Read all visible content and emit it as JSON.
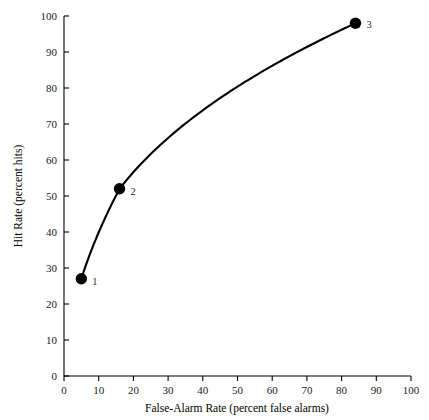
{
  "chart_data": {
    "type": "line",
    "title": "",
    "subtitle": "",
    "xlabel": "False-Alarm Rate (percent false alarms)",
    "ylabel": "Hit Rate (percent hits)",
    "xlim": [
      0,
      100
    ],
    "ylim": [
      0,
      100
    ],
    "grid": false,
    "legend": false,
    "x_ticks": [
      0,
      10,
      20,
      30,
      40,
      50,
      60,
      70,
      80,
      90,
      100
    ],
    "y_ticks": [
      0,
      10,
      20,
      30,
      40,
      50,
      60,
      70,
      80,
      90,
      100
    ],
    "x_tick_labels": [
      "0",
      "10",
      "20",
      "30",
      "40",
      "50",
      "60",
      "70",
      "80",
      "90",
      "100"
    ],
    "y_tick_labels": [
      "0",
      "10",
      "20",
      "30",
      "40",
      "50",
      "60",
      "70",
      "80",
      "90",
      "100"
    ],
    "series": [
      {
        "name": "ROC curve",
        "color": "#000000",
        "x": [
          5,
          16,
          84
        ],
        "y": [
          27,
          52,
          98
        ],
        "point_labels": [
          "1",
          "2",
          "3"
        ],
        "marker": "filled-circle",
        "marker_size": 7,
        "line_style": "smooth-solid"
      }
    ],
    "annotations": [
      {
        "text": "1",
        "x": 5,
        "y": 27,
        "offset_x": 11,
        "offset_y": 6
      },
      {
        "text": "2",
        "x": 16,
        "y": 52,
        "offset_x": 11,
        "offset_y": 6
      },
      {
        "text": "3",
        "x": 84,
        "y": 98,
        "offset_x": 11,
        "offset_y": 5
      }
    ]
  }
}
